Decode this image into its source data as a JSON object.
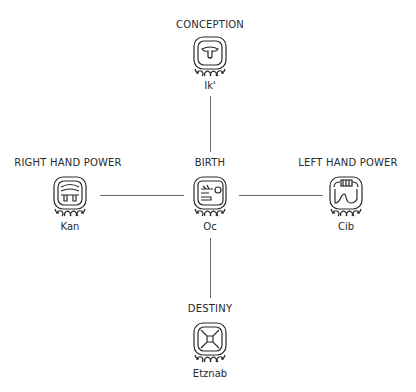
{
  "diagram": {
    "connector_color": "#6a6a6a",
    "nodes": [
      {
        "id": "top",
        "role": "CONCEPTION",
        "day_sign": "Ik'",
        "icon": "ik-glyph-icon"
      },
      {
        "id": "left",
        "role": "RIGHT HAND POWER",
        "day_sign": "Kan",
        "icon": "kan-glyph-icon"
      },
      {
        "id": "center",
        "role": "BIRTH",
        "day_sign": "Oc",
        "icon": "oc-glyph-icon"
      },
      {
        "id": "right",
        "role": "LEFT HAND POWER",
        "day_sign": "Cib",
        "icon": "cib-glyph-icon"
      },
      {
        "id": "bottom",
        "role": "DESTINY",
        "day_sign": "Etznab",
        "icon": "etznab-glyph-icon"
      }
    ],
    "edges": [
      {
        "from": "center",
        "to": "top"
      },
      {
        "from": "center",
        "to": "left"
      },
      {
        "from": "center",
        "to": "right"
      },
      {
        "from": "center",
        "to": "bottom"
      }
    ]
  }
}
